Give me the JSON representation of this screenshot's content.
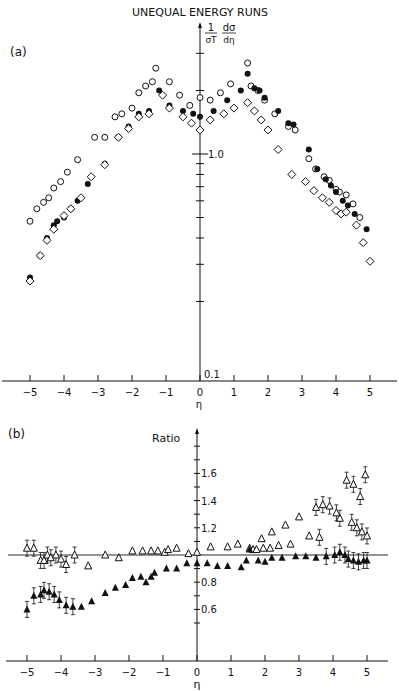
{
  "title": "UNEQUAL ENERGY RUNS",
  "chart_data": [
    {
      "panel": "(a)",
      "type": "scatter",
      "ylabel": "1/σT dσ/dη",
      "xlabel": "η",
      "yscale": "log",
      "ylim": [
        0.1,
        3.2
      ],
      "xlim": [
        -5.7,
        5.9
      ],
      "xticks": [
        -5,
        -4,
        -3,
        -2,
        -1,
        0,
        1,
        2,
        3,
        4,
        5
      ],
      "ytick_labels": [
        "1.0",
        "0.1"
      ],
      "series": [
        {
          "name": "open circles",
          "marker": "circle-open",
          "points": [
            [
              -5.0,
              0.48
            ],
            [
              -4.8,
              0.55
            ],
            [
              -4.6,
              0.59
            ],
            [
              -4.45,
              0.62
            ],
            [
              -4.3,
              0.69
            ],
            [
              -4.1,
              0.74
            ],
            [
              -3.9,
              0.82
            ],
            [
              -3.6,
              0.94
            ],
            [
              -3.1,
              1.2
            ],
            [
              -2.8,
              1.2
            ],
            [
              -2.5,
              1.5
            ],
            [
              -2.3,
              1.55
            ],
            [
              -2.0,
              1.65
            ],
            [
              -1.8,
              1.95
            ],
            [
              -1.6,
              2.1
            ],
            [
              -1.4,
              2.2
            ],
            [
              -1.3,
              2.55
            ],
            [
              -0.9,
              2.2
            ],
            [
              -0.6,
              1.9
            ],
            [
              -0.3,
              1.7
            ],
            [
              0.0,
              1.85
            ],
            [
              0.3,
              1.8
            ],
            [
              0.6,
              1.95
            ],
            [
              0.9,
              2.15
            ],
            [
              1.4,
              2.7
            ],
            [
              1.5,
              2.1
            ],
            [
              1.7,
              2.0
            ],
            [
              1.9,
              1.8
            ],
            [
              2.2,
              1.55
            ],
            [
              2.6,
              1.35
            ],
            [
              2.8,
              1.3
            ],
            [
              3.2,
              0.95
            ],
            [
              3.4,
              0.85
            ],
            [
              3.65,
              0.78
            ],
            [
              3.8,
              0.75
            ],
            [
              4.0,
              0.68
            ],
            [
              4.1,
              0.66
            ],
            [
              4.3,
              0.64
            ],
            [
              4.5,
              0.58
            ],
            [
              4.7,
              0.5
            ]
          ]
        },
        {
          "name": "filled circles",
          "marker": "circle-filled",
          "points": [
            [
              -5.0,
              0.26
            ],
            [
              -4.7,
              0.33
            ],
            [
              -4.5,
              0.4
            ],
            [
              -4.3,
              0.46
            ],
            [
              -4.2,
              0.48
            ],
            [
              -4.0,
              0.5
            ],
            [
              -3.8,
              0.55
            ],
            [
              -3.6,
              0.6
            ],
            [
              -3.3,
              0.72
            ],
            [
              -2.8,
              0.9
            ],
            [
              -2.4,
              1.2
            ],
            [
              -2.1,
              1.35
            ],
            [
              -1.8,
              1.55
            ],
            [
              -1.5,
              1.6
            ],
            [
              -1.2,
              2.0
            ],
            [
              -0.9,
              1.7
            ],
            [
              -0.5,
              1.6
            ],
            [
              -0.2,
              1.55
            ],
            [
              0.0,
              1.5
            ],
            [
              0.4,
              1.6
            ],
            [
              0.8,
              1.8
            ],
            [
              1.2,
              2.0
            ],
            [
              1.4,
              2.4
            ],
            [
              1.6,
              2.05
            ],
            [
              1.75,
              2.0
            ],
            [
              1.9,
              1.85
            ],
            [
              2.3,
              1.6
            ],
            [
              2.6,
              1.4
            ],
            [
              2.75,
              1.38
            ],
            [
              3.2,
              1.05
            ],
            [
              3.45,
              0.85
            ],
            [
              3.7,
              0.76
            ],
            [
              3.85,
              0.71
            ],
            [
              4.0,
              0.66
            ],
            [
              4.2,
              0.6
            ],
            [
              4.35,
              0.57
            ],
            [
              4.55,
              0.52
            ],
            [
              4.9,
              0.44
            ]
          ]
        },
        {
          "name": "open diamonds",
          "marker": "diamond-open",
          "points": [
            [
              -5.0,
              0.25
            ],
            [
              -4.7,
              0.33
            ],
            [
              -4.5,
              0.39
            ],
            [
              -4.3,
              0.44
            ],
            [
              -4.0,
              0.51
            ],
            [
              -3.8,
              0.55
            ],
            [
              -3.5,
              0.62
            ],
            [
              -3.2,
              0.78
            ],
            [
              -2.8,
              0.89
            ],
            [
              -2.4,
              1.2
            ],
            [
              -2.1,
              1.32
            ],
            [
              -1.8,
              1.5
            ],
            [
              -1.5,
              1.55
            ],
            [
              -1.1,
              1.9
            ],
            [
              -0.9,
              1.65
            ],
            [
              -0.5,
              1.5
            ],
            [
              -0.25,
              1.4
            ],
            [
              0.0,
              1.3
            ],
            [
              0.3,
              1.45
            ],
            [
              0.7,
              1.55
            ],
            [
              1.0,
              1.65
            ],
            [
              1.4,
              1.75
            ],
            [
              1.6,
              1.6
            ],
            [
              1.8,
              1.45
            ],
            [
              2.0,
              1.3
            ],
            [
              2.3,
              1.05
            ],
            [
              2.7,
              0.8
            ],
            [
              3.1,
              0.74
            ],
            [
              3.35,
              0.67
            ],
            [
              3.6,
              0.62
            ],
            [
              3.8,
              0.59
            ],
            [
              4.0,
              0.54
            ],
            [
              4.15,
              0.52
            ],
            [
              4.3,
              0.53
            ],
            [
              4.6,
              0.46
            ],
            [
              4.8,
              0.38
            ],
            [
              5.0,
              0.31
            ]
          ]
        }
      ]
    },
    {
      "panel": "(b)",
      "type": "scatter",
      "ylabel": "Ratio",
      "xlabel": "η",
      "ylim": [
        0.4,
        1.9
      ],
      "xlim": [
        -5.7,
        5.9
      ],
      "xticks": [
        -5,
        -4,
        -3,
        -2,
        -1,
        0,
        1,
        2,
        3,
        4,
        5
      ],
      "yticks": [
        0.6,
        0.8,
        1.2,
        1.4,
        1.6
      ],
      "reference_line": 1.0,
      "series": [
        {
          "name": "open triangles",
          "marker": "triangle-open",
          "points": [
            [
              -5.0,
              1.05
            ],
            [
              -4.8,
              1.05
            ],
            [
              -4.6,
              0.96
            ],
            [
              -4.5,
              0.96
            ],
            [
              -4.4,
              1.0
            ],
            [
              -4.3,
              0.98
            ],
            [
              -4.15,
              1.0
            ],
            [
              -4.0,
              0.97
            ],
            [
              -3.85,
              0.93
            ],
            [
              -3.6,
              1.0
            ],
            [
              -3.2,
              0.92
            ],
            [
              -2.7,
              1.0
            ],
            [
              -2.3,
              0.98
            ],
            [
              -1.9,
              1.03
            ],
            [
              -1.6,
              1.03
            ],
            [
              -1.35,
              1.03
            ],
            [
              -1.15,
              1.03
            ],
            [
              -0.95,
              1.02
            ],
            [
              -0.85,
              1.04
            ],
            [
              -0.6,
              1.05
            ],
            [
              -0.25,
              1.01
            ],
            [
              0.0,
              1.02
            ],
            [
              0.4,
              1.06
            ],
            [
              0.9,
              1.06
            ],
            [
              1.2,
              1.08
            ],
            [
              1.9,
              1.12
            ],
            [
              2.2,
              1.17
            ],
            [
              2.6,
              1.22
            ],
            [
              3.0,
              1.28
            ],
            [
              3.5,
              1.35
            ],
            [
              3.7,
              1.37
            ],
            [
              3.9,
              1.36
            ],
            [
              4.2,
              1.27
            ],
            [
              4.55,
              1.24
            ],
            [
              4.7,
              1.2
            ],
            [
              4.85,
              1.17
            ],
            [
              5.0,
              1.14
            ],
            [
              1.55,
              1.05
            ],
            [
              1.65,
              1.04
            ],
            [
              1.75,
              1.04
            ],
            [
              1.95,
              1.05
            ],
            [
              2.15,
              1.05
            ],
            [
              2.4,
              1.07
            ],
            [
              2.75,
              1.08
            ],
            [
              3.3,
              1.14
            ],
            [
              3.6,
              1.13
            ],
            [
              4.1,
              1.31
            ],
            [
              4.4,
              1.55
            ],
            [
              4.6,
              1.52
            ],
            [
              4.8,
              1.43
            ],
            [
              4.95,
              1.59
            ]
          ]
        },
        {
          "name": "filled triangles",
          "marker": "triangle-filled",
          "points": [
            [
              -5.0,
              0.6
            ],
            [
              -4.8,
              0.7
            ],
            [
              -4.6,
              0.71
            ],
            [
              -4.5,
              0.74
            ],
            [
              -4.35,
              0.73
            ],
            [
              -4.2,
              0.71
            ],
            [
              -4.05,
              0.67
            ],
            [
              -3.85,
              0.63
            ],
            [
              -3.65,
              0.62
            ],
            [
              -3.4,
              0.62
            ],
            [
              -3.1,
              0.66
            ],
            [
              -2.7,
              0.72
            ],
            [
              -2.4,
              0.76
            ],
            [
              -2.1,
              0.78
            ],
            [
              -1.9,
              0.83
            ],
            [
              -1.65,
              0.84
            ],
            [
              -1.5,
              0.8
            ],
            [
              -1.35,
              0.84
            ],
            [
              -1.25,
              0.87
            ],
            [
              -0.9,
              0.9
            ],
            [
              -0.6,
              0.9
            ],
            [
              -0.3,
              0.94
            ],
            [
              0.0,
              0.94
            ],
            [
              0.3,
              0.94
            ],
            [
              0.6,
              0.92
            ],
            [
              0.9,
              0.92
            ],
            [
              1.3,
              0.91
            ],
            [
              1.45,
              0.96
            ],
            [
              1.55,
              1.04
            ],
            [
              1.8,
              0.96
            ],
            [
              2.0,
              0.95
            ],
            [
              2.2,
              0.98
            ],
            [
              2.5,
              0.98
            ],
            [
              2.9,
              0.99
            ],
            [
              3.2,
              0.99
            ],
            [
              3.5,
              0.98
            ],
            [
              3.8,
              0.99
            ],
            [
              4.05,
              1.0
            ],
            [
              4.2,
              1.02
            ],
            [
              4.35,
              1.0
            ],
            [
              4.45,
              0.97
            ],
            [
              4.6,
              0.96
            ],
            [
              4.75,
              0.95
            ],
            [
              4.9,
              0.96
            ],
            [
              5.0,
              0.96
            ]
          ]
        }
      ]
    }
  ],
  "labels": {
    "panel_a": "(a)",
    "panel_b": "(b)",
    "ylabel_a_num": "1",
    "ylabel_a_den": "σT",
    "ylabel_a_num2": "dσ",
    "ylabel_a_den2": "dη",
    "ytick_a_1": "1.0",
    "ytick_a_01": "0.1",
    "xlabel": "η",
    "ylabel_b": "Ratio",
    "xticks": [
      "-5",
      "-4",
      "-3",
      "-2",
      "-1",
      "0",
      "1",
      "2",
      "3",
      "4",
      "5"
    ],
    "yticks_b": [
      "1.6",
      "1.4",
      "1.2",
      "0.8",
      "0.6"
    ]
  }
}
